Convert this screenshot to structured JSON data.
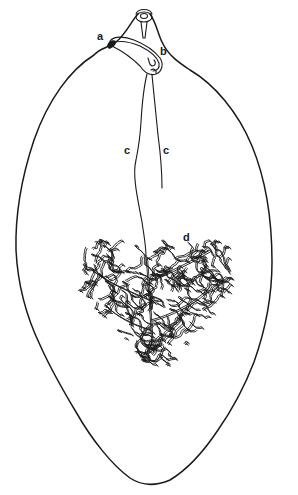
{
  "figure": {
    "title": "",
    "labels": {
      "a": "a",
      "b": "b",
      "c_left": "c",
      "c_right": "c",
      "d": "d"
    },
    "colors": {
      "ink": "#1a1a1a",
      "background": "#ffffff"
    }
  }
}
